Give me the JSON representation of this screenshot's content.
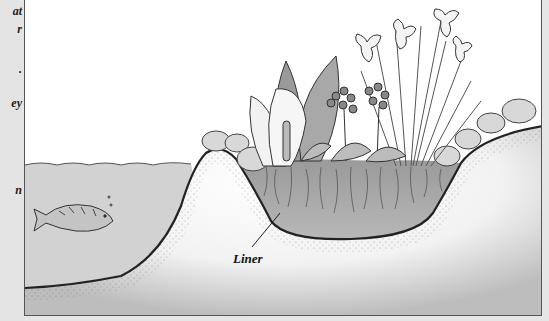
{
  "sidebar": {
    "fragments": [
      {
        "text": "at",
        "top": 4
      },
      {
        "text": "r",
        "top": 22
      },
      {
        "text": ".",
        "top": 62
      },
      {
        "text": "ey",
        "top": 96
      },
      {
        "text": "n",
        "top": 183
      }
    ]
  },
  "illustration": {
    "title": "Pond and bog garden cross-section",
    "labels": {
      "liner": "Liner"
    },
    "elements": {
      "water": "pond-water",
      "fish": "koi-fish",
      "mound": "soil-mound",
      "bog": "bog-garden-bed",
      "plants": [
        "skunk-cabbage",
        "primula",
        "iris",
        "hosta"
      ],
      "rocks": "edging-stones"
    },
    "colors": {
      "water": "#cfcfcf",
      "soil": "#8a8a8a",
      "liner": "#222222",
      "border": "#555555",
      "background": "#ffffff"
    }
  }
}
